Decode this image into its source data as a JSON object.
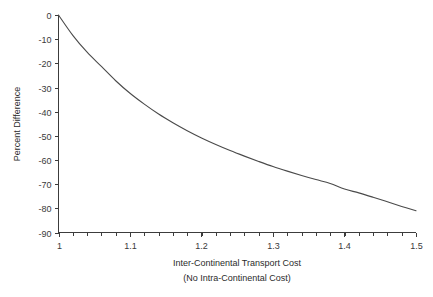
{
  "chart_data": {
    "type": "line",
    "title": "",
    "xlabel": "Inter-Continental Transport Cost",
    "xlabel_sub": "(No Intra-Continental Cost)",
    "ylabel": "Percent Difference",
    "xlim": [
      1.0,
      1.5
    ],
    "ylim": [
      -90,
      0
    ],
    "grid": false,
    "legend": "none",
    "line_color": "#4a4a4a",
    "xticks": [
      1,
      1.1,
      1.2,
      1.3,
      1.4,
      1.5
    ],
    "xtick_labels": [
      "1",
      "1.1",
      "1.2",
      "1.3",
      "1.4",
      "1.5"
    ],
    "x_minor_tick_step": 0.02,
    "yticks": [
      0,
      -10,
      -20,
      -30,
      -40,
      -50,
      -60,
      -70,
      -80,
      -90
    ],
    "ytick_labels": [
      "0",
      "-10",
      "-20",
      "-30",
      "-40",
      "-50",
      "-60",
      "-70",
      "-80",
      "-90"
    ],
    "series": [
      {
        "name": "Percent Difference",
        "x": [
          1.0,
          1.02,
          1.04,
          1.06,
          1.08,
          1.1,
          1.12,
          1.14,
          1.16,
          1.18,
          1.2,
          1.22,
          1.24,
          1.26,
          1.28,
          1.3,
          1.32,
          1.34,
          1.36,
          1.38,
          1.4,
          1.42,
          1.44,
          1.46,
          1.48,
          1.5
        ],
        "y": [
          0.0,
          -8.4,
          -15.4,
          -21.3,
          -27.2,
          -32.4,
          -36.9,
          -41.0,
          -44.6,
          -47.9,
          -50.9,
          -53.6,
          -56.1,
          -58.4,
          -60.6,
          -62.7,
          -64.6,
          -66.4,
          -68.1,
          -69.7,
          -72.0,
          -73.6,
          -75.4,
          -77.3,
          -79.2,
          -81.0
        ]
      }
    ]
  },
  "axes": {
    "x_tick_count": 6,
    "y_tick_count": 10
  }
}
